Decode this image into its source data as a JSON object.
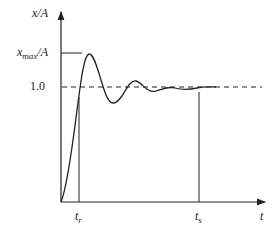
{
  "diagram": {
    "y_axis_label": "x/A",
    "x_axis_label": "t",
    "levels": {
      "xmax_label_main": "x",
      "xmax_label_sub": "max",
      "xmax_label_tail": "/A",
      "steady_label": "1.0"
    },
    "markers": {
      "rise_main": "t",
      "rise_sub": "r",
      "settle_main": "t",
      "settle_sub": "s"
    },
    "colors": {
      "stroke": "#222222",
      "background": "#ffffff"
    }
  }
}
